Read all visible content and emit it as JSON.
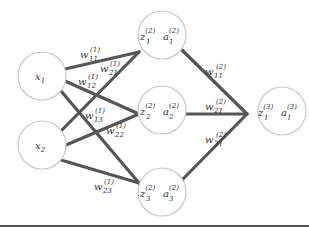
{
  "diagram": {
    "colors": {
      "edge": "#555555",
      "node_stroke": "#c8c8c8",
      "text": "#333333",
      "background": "#ffffff"
    },
    "nodes": {
      "x1": {
        "main": "x",
        "sub": "1",
        "sup": ""
      },
      "x2": {
        "main": "x",
        "sub": "2",
        "sup": ""
      },
      "h1": {
        "z": {
          "main": "z",
          "sub": "1",
          "sup": "(2)"
        },
        "a": {
          "main": "a",
          "sub": "1",
          "sup": "(2)"
        }
      },
      "h2": {
        "z": {
          "main": "z",
          "sub": "2",
          "sup": "(2)"
        },
        "a": {
          "main": "a",
          "sub": "2",
          "sup": "(2)"
        }
      },
      "h3": {
        "z": {
          "main": "z",
          "sub": "3",
          "sup": "(2)"
        },
        "a": {
          "main": "a",
          "sub": "3",
          "sup": "(2)"
        }
      },
      "o1": {
        "z": {
          "main": "z",
          "sub": "1",
          "sup": "(3)"
        },
        "a": {
          "main": "a",
          "sub": "1",
          "sup": "(3)"
        }
      }
    },
    "weights": {
      "w11_1": {
        "main": "w",
        "sub": "11",
        "sup": "(1)"
      },
      "w12_1": {
        "main": "w",
        "sub": "12",
        "sup": "(1)"
      },
      "w13_1": {
        "main": "w",
        "sub": "13",
        "sup": "(1)"
      },
      "w21_1": {
        "main": "w",
        "sub": "21",
        "sup": "(1)"
      },
      "w22_1": {
        "main": "w",
        "sub": "22",
        "sup": "(1)"
      },
      "w23_1": {
        "main": "w",
        "sub": "23",
        "sup": "(1)"
      },
      "w11_2": {
        "main": "w",
        "sub": "11",
        "sup": "(2)"
      },
      "w21_2": {
        "main": "w",
        "sub": "21",
        "sup": "(2)"
      },
      "w31_2": {
        "main": "w",
        "sub": "31",
        "sup": "(2)"
      }
    }
  }
}
